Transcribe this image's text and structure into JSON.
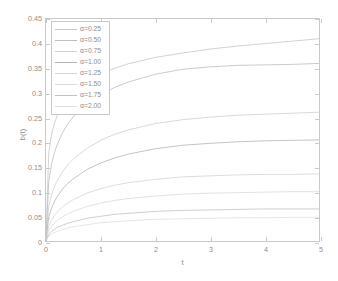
{
  "chart_data": {
    "type": "line",
    "title": "",
    "xlabel": "t",
    "ylabel": "b(t)",
    "xlim": [
      0,
      5
    ],
    "ylim": [
      0,
      0.45
    ],
    "grid": false,
    "legend_position": "top-left inside axes",
    "xticks": [
      "0",
      "1",
      "2",
      "3",
      "4",
      "5"
    ],
    "xtick_values": [
      0,
      1,
      2,
      3,
      4,
      5
    ],
    "yticks": [
      "0",
      "0.05",
      "0.1",
      "0.15",
      "0.2",
      "0.25",
      "0.3",
      "0.35",
      "0.4",
      "0.45"
    ],
    "ytick_values": [
      0,
      0.05,
      0.1,
      0.15,
      0.2,
      0.25,
      0.3,
      0.35,
      0.4,
      0.45
    ],
    "x": [
      0,
      0.05,
      0.1,
      0.15,
      0.2,
      0.3,
      0.4,
      0.5,
      0.75,
      1,
      1.25,
      1.5,
      2,
      2.5,
      3,
      3.5,
      4,
      4.5,
      5
    ],
    "series": [
      {
        "name": "α=0.25",
        "color": "#c6c6c6",
        "values": [
          0,
          0.178,
          0.215,
          0.237,
          0.253,
          0.276,
          0.292,
          0.304,
          0.325,
          0.339,
          0.35,
          0.359,
          0.372,
          0.381,
          0.389,
          0.395,
          0.4,
          0.405,
          0.41
        ],
        "end_value": 0.41
      },
      {
        "name": "α=0.50",
        "color": "#bdbdbd",
        "values": [
          0,
          0.12,
          0.155,
          0.177,
          0.194,
          0.219,
          0.238,
          0.252,
          0.279,
          0.297,
          0.311,
          0.322,
          0.338,
          0.348,
          0.353,
          0.356,
          0.357,
          0.358,
          0.36
        ],
        "end_value": 0.36
      },
      {
        "name": "α=0.75",
        "color": "#cfcfcf",
        "values": [
          0,
          0.07,
          0.093,
          0.109,
          0.121,
          0.14,
          0.155,
          0.166,
          0.188,
          0.204,
          0.216,
          0.225,
          0.238,
          0.246,
          0.251,
          0.255,
          0.257,
          0.259,
          0.261
        ],
        "end_value": 0.261
      },
      {
        "name": "α=1.00",
        "color": "#b5b5b5",
        "values": [
          0,
          0.048,
          0.066,
          0.079,
          0.089,
          0.105,
          0.117,
          0.126,
          0.145,
          0.158,
          0.168,
          0.176,
          0.187,
          0.194,
          0.198,
          0.201,
          0.203,
          0.204,
          0.205
        ],
        "end_value": 0.205
      },
      {
        "name": "α=1.25",
        "color": "#d4d4d4",
        "values": [
          0,
          0.03,
          0.042,
          0.051,
          0.058,
          0.069,
          0.077,
          0.084,
          0.097,
          0.106,
          0.113,
          0.118,
          0.125,
          0.13,
          0.132,
          0.134,
          0.135,
          0.135,
          0.136
        ],
        "end_value": 0.136
      },
      {
        "name": "α=1.50",
        "color": "#dadada",
        "values": [
          0,
          0.021,
          0.029,
          0.036,
          0.041,
          0.049,
          0.055,
          0.06,
          0.07,
          0.077,
          0.082,
          0.086,
          0.091,
          0.095,
          0.097,
          0.098,
          0.099,
          0.1,
          0.1
        ],
        "end_value": 0.1
      },
      {
        "name": "α=1.75",
        "color": "#c2c2c2",
        "values": [
          0,
          0.013,
          0.019,
          0.023,
          0.027,
          0.032,
          0.036,
          0.039,
          0.046,
          0.05,
          0.054,
          0.056,
          0.06,
          0.062,
          0.063,
          0.064,
          0.065,
          0.065,
          0.065
        ],
        "end_value": 0.065
      },
      {
        "name": "α=2.00",
        "color": "#dedede",
        "values": [
          0,
          0.009,
          0.013,
          0.017,
          0.019,
          0.023,
          0.026,
          0.029,
          0.033,
          0.037,
          0.039,
          0.041,
          0.044,
          0.045,
          0.046,
          0.047,
          0.047,
          0.048,
          0.048
        ],
        "end_value": 0.048
      }
    ]
  },
  "axes": {
    "frame_color": "#c9c9c9",
    "tick_label_color": "#8d8d8d"
  }
}
